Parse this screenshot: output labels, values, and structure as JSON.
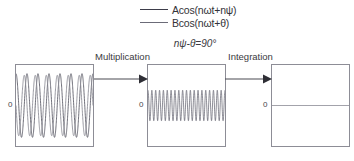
{
  "figure": {
    "legend": [
      {
        "label": "Acos(nωt+nψ)",
        "color": "#3d3d4a",
        "name": "series-a"
      },
      {
        "label": "Bcos(nωt+θ)",
        "color": "#6b6b78",
        "name": "series-b"
      }
    ],
    "phase_note": "nψ-θ=90°",
    "stages": {
      "multiplication": "Multiplication",
      "integration": "Integration"
    },
    "axis_zero_label": "0"
  },
  "chart_data": [
    {
      "type": "line",
      "name": "input-signals",
      "title": "",
      "xlabel": "",
      "ylabel": "",
      "ylim": [
        -1.15,
        1.15
      ],
      "xlim": [
        0,
        1
      ],
      "grid": false,
      "legend_position": "top",
      "yticks": [
        0
      ],
      "ytick_labels": [
        "0"
      ],
      "series": [
        {
          "name": "Acos(nωt+nψ)",
          "color": "#5a5a66",
          "amplitude": 1.0,
          "cycles": 7.0,
          "phase_deg": 0
        },
        {
          "name": "Bcos(nωt+θ)",
          "color": "#8b8b95",
          "amplitude": 0.95,
          "cycles": 7.0,
          "phase_deg": 90
        }
      ]
    },
    {
      "type": "line",
      "name": "product-signal",
      "title": "",
      "xlabel": "",
      "ylabel": "",
      "ylim": [
        -1.15,
        1.15
      ],
      "xlim": [
        0,
        1
      ],
      "grid": false,
      "legend_position": "none",
      "yticks": [
        0
      ],
      "ytick_labels": [
        "0"
      ],
      "series": [
        {
          "name": "A·B·cos·cos",
          "color": "#6c6c78",
          "amplitude": 0.48,
          "offset": 0.0,
          "cycles": 20.0,
          "phase_deg": 0
        }
      ]
    },
    {
      "type": "line",
      "name": "integrated-signal",
      "title": "",
      "xlabel": "",
      "ylabel": "",
      "ylim": [
        -1.15,
        1.15
      ],
      "xlim": [
        0,
        1
      ],
      "grid": false,
      "legend_position": "none",
      "yticks": [
        0
      ],
      "ytick_labels": [
        "0"
      ],
      "series": [
        {
          "name": "integral-result",
          "color": "#6c6c78",
          "amplitude": 0.0,
          "offset": 0.0,
          "cycles": 0,
          "phase_deg": 0
        }
      ]
    }
  ]
}
